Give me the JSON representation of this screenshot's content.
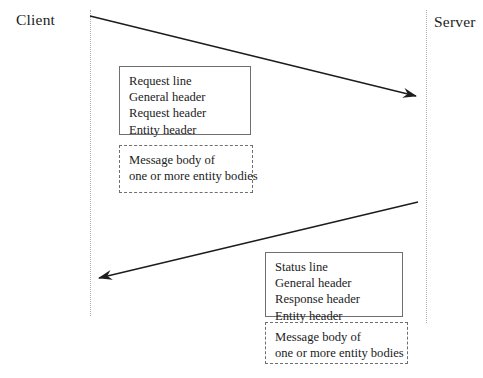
{
  "diagram": {
    "type": "sequence-diagram",
    "background_color": "#ffffff",
    "line_color": "#1c1c1c",
    "lifeline_color": "#b0b0b0",
    "box_border_color": "#6f6f6f"
  },
  "participants": {
    "client": {
      "label": "Client"
    },
    "server": {
      "label": "Server"
    }
  },
  "messages": [
    {
      "name": "request",
      "direction": "client-to-server",
      "headers_box": {
        "style": "solid",
        "lines": [
          "Request line",
          "General header",
          "Request header",
          "Entity header"
        ]
      },
      "body_box": {
        "style": "dashed",
        "lines": [
          "Message body of",
          "one or more entity bodies"
        ]
      }
    },
    {
      "name": "response",
      "direction": "server-to-client",
      "headers_box": {
        "style": "solid",
        "lines": [
          "Status line",
          "General header",
          "Response header",
          "Entity header"
        ]
      },
      "body_box": {
        "style": "dashed",
        "lines": [
          "Message body of",
          "one or more entity bodies"
        ]
      }
    }
  ]
}
